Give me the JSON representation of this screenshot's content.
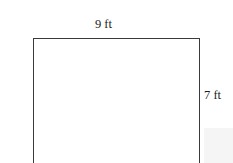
{
  "figure": {
    "type": "rectangle-dimension-diagram",
    "background_color": "#ffffff",
    "stroke_color": "#3a3a3a",
    "text_color": "#1c1c1c",
    "panel_color": "#f5f5f6",
    "labels": {
      "top": "9 ft",
      "right": "7 ft"
    },
    "measurements": [
      {
        "side": "top",
        "value": 9,
        "unit": "ft",
        "text": "9 ft"
      },
      {
        "side": "right",
        "value": 7,
        "unit": "ft",
        "text": "7 ft"
      }
    ]
  }
}
